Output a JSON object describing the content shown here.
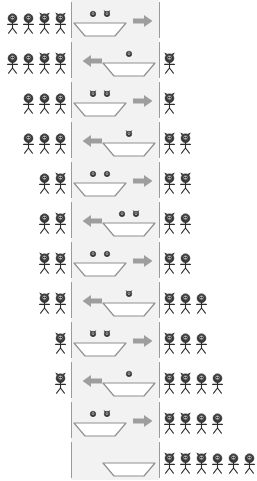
{
  "diagram": {
    "legend": {
      "missionary": "plain-head-figure",
      "cannibal": "horned-head-figure"
    },
    "colors": {
      "river": "#f2f2f2",
      "bank_line": "#9a9a9a",
      "figure_head": "#3c3c3c",
      "figure_head_light": "#d9d9d9",
      "figure_body": "#2b2b2b",
      "boat": "#ffffff",
      "boat_outline": "#8f8f8f",
      "arrow": "#9e9e9e",
      "background": "#ffffff"
    },
    "geometry": {
      "width": 236,
      "height": 478,
      "row_height": 40,
      "river_left": 71,
      "river_right": 159
    },
    "states": [
      {
        "index": 1,
        "left_bank": [
          "missionary",
          "missionary",
          "cannibal",
          "cannibal"
        ],
        "boat": {
          "side": "left",
          "direction": "right",
          "passengers": [
            "missionary",
            "cannibal"
          ]
        },
        "right_bank": []
      },
      {
        "index": 2,
        "left_bank": [
          "missionary",
          "missionary",
          "cannibal",
          "cannibal"
        ],
        "boat": {
          "side": "right",
          "direction": "left",
          "passengers": [
            "missionary"
          ]
        },
        "right_bank": [
          "cannibal"
        ]
      },
      {
        "index": 3,
        "left_bank": [
          "missionary",
          "missionary",
          "missionary"
        ],
        "boat": {
          "side": "left",
          "direction": "right",
          "passengers": [
            "cannibal",
            "cannibal"
          ]
        },
        "right_bank": [
          "cannibal"
        ]
      },
      {
        "index": 4,
        "left_bank": [
          "missionary",
          "missionary",
          "missionary"
        ],
        "boat": {
          "side": "right",
          "direction": "left",
          "passengers": [
            "cannibal"
          ]
        },
        "right_bank": [
          "cannibal",
          "cannibal"
        ]
      },
      {
        "index": 5,
        "left_bank": [
          "missionary",
          "cannibal"
        ],
        "boat": {
          "side": "left",
          "direction": "right",
          "passengers": [
            "missionary",
            "missionary"
          ]
        },
        "right_bank": [
          "cannibal",
          "cannibal"
        ]
      },
      {
        "index": 6,
        "left_bank": [
          "missionary",
          "cannibal"
        ],
        "boat": {
          "side": "right",
          "direction": "left",
          "passengers": [
            "missionary",
            "cannibal"
          ]
        },
        "right_bank": [
          "cannibal",
          "missionary"
        ]
      },
      {
        "index": 7,
        "left_bank": [
          "cannibal",
          "cannibal"
        ],
        "boat": {
          "side": "left",
          "direction": "right",
          "passengers": [
            "missionary",
            "missionary"
          ]
        },
        "right_bank": [
          "cannibal",
          "missionary"
        ]
      },
      {
        "index": 8,
        "left_bank": [
          "cannibal",
          "cannibal"
        ],
        "boat": {
          "side": "right",
          "direction": "left",
          "passengers": [
            "cannibal"
          ]
        },
        "right_bank": [
          "cannibal",
          "missionary",
          "missionary"
        ]
      },
      {
        "index": 9,
        "left_bank": [
          "cannibal"
        ],
        "boat": {
          "side": "left",
          "direction": "right",
          "passengers": [
            "cannibal",
            "cannibal"
          ]
        },
        "right_bank": [
          "cannibal",
          "missionary",
          "missionary"
        ]
      },
      {
        "index": 10,
        "left_bank": [
          "cannibal"
        ],
        "boat": {
          "side": "right",
          "direction": "left",
          "passengers": [
            "missionary"
          ]
        },
        "right_bank": [
          "cannibal",
          "cannibal",
          "missionary",
          "missionary"
        ]
      },
      {
        "index": 11,
        "left_bank": [],
        "boat": {
          "side": "left",
          "direction": "right",
          "passengers": [
            "missionary",
            "cannibal"
          ]
        },
        "right_bank": [
          "cannibal",
          "cannibal",
          "missionary",
          "missionary"
        ]
      },
      {
        "index": 12,
        "left_bank": [],
        "boat": {
          "side": "right",
          "direction": "none",
          "passengers": []
        },
        "right_bank": [
          "cannibal",
          "cannibal",
          "cannibal",
          "missionary",
          "missionary",
          "missionary"
        ]
      }
    ]
  }
}
